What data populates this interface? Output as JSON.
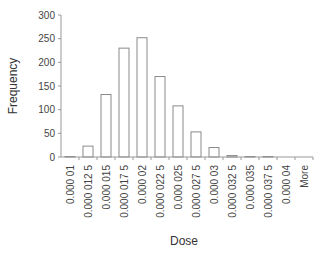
{
  "chart_data": {
    "type": "bar",
    "title": "",
    "xlabel": "Dose",
    "ylabel": "Frequency",
    "ylim": [
      0,
      300
    ],
    "yticks": [
      0,
      50,
      100,
      150,
      200,
      250,
      300
    ],
    "grid": false,
    "legend": null,
    "categories": [
      "0.000 01",
      "0.000 012 5",
      "0.000 015",
      "0.000 017 5",
      "0.000 02",
      "0.000 022 5",
      "0.000 025",
      "0.000 027 5",
      "0.000 03",
      "0.000 032 5",
      "0.000 035",
      "0.000 037 5",
      "0.000 04",
      "More"
    ],
    "values": [
      1,
      23,
      132,
      230,
      252,
      170,
      108,
      53,
      20,
      3,
      1,
      1,
      0,
      0
    ],
    "bar_fill": "#ffffff",
    "bar_stroke": "#8a8a8a",
    "axis_color": "#999999"
  }
}
